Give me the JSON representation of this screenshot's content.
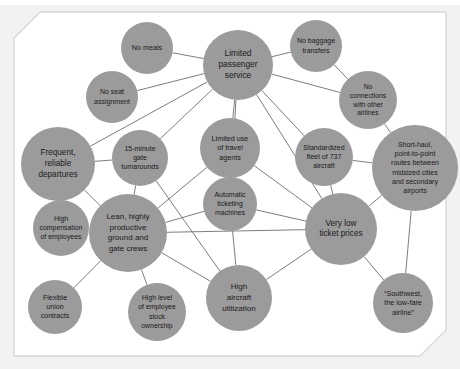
{
  "figure": {
    "name": "southwest-airlines-activity-system-map",
    "background_color": "#f2f2f0",
    "panel_color": "#ffffff",
    "node_color": "#9b9b9b",
    "edge_color": "#6e6e6e",
    "label_color": "#1a1a1a"
  },
  "chart_data": {
    "type": "diagram",
    "subtype": "activity-system-map",
    "title": "",
    "nodes": [
      {
        "id": "no_meals",
        "label": "No meals",
        "cx": 147,
        "cy": 48,
        "r": 26,
        "font_size": 7.2,
        "lines": [
          "No meals"
        ]
      },
      {
        "id": "no_seat",
        "label": "No seat assignment",
        "cx": 112,
        "cy": 97,
        "r": 26,
        "font_size": 7.0,
        "lines": [
          "No seat",
          "assignment"
        ]
      },
      {
        "id": "limited_passenger",
        "label": "Limited passenger service",
        "cx": 238,
        "cy": 65,
        "r": 35,
        "font_size": 8.4,
        "lines": [
          "Limited",
          "passenger",
          "service"
        ]
      },
      {
        "id": "no_baggage",
        "label": "No baggage transfers",
        "cx": 316,
        "cy": 46,
        "r": 26,
        "font_size": 7.0,
        "lines": [
          "No baggage",
          "transfers"
        ]
      },
      {
        "id": "no_connections",
        "label": "No connections with other airlines",
        "cx": 368,
        "cy": 100,
        "r": 29,
        "font_size": 6.8,
        "lines": [
          "No",
          "connections",
          "with other",
          "airlines"
        ]
      },
      {
        "id": "frequent_departures",
        "label": "Frequent, reliable departures",
        "cx": 58,
        "cy": 164,
        "r": 37,
        "font_size": 8.2,
        "lines": [
          "Frequent,",
          "reliable",
          "departures"
        ]
      },
      {
        "id": "gate_turnarounds",
        "label": "15-minute gate turnarounds",
        "cx": 140,
        "cy": 158,
        "r": 28,
        "font_size": 7.0,
        "lines": [
          "15-minute",
          "gate",
          "turnarounds"
        ]
      },
      {
        "id": "travel_agents",
        "label": "Limited use of travel agents",
        "cx": 230,
        "cy": 148,
        "r": 30,
        "font_size": 7.2,
        "lines": [
          "Limited use",
          "of travel",
          "agents"
        ]
      },
      {
        "id": "standardized_fleet",
        "label": "Standardized fleet of 737 aircraft",
        "cx": 324,
        "cy": 157,
        "r": 29,
        "font_size": 7.0,
        "lines": [
          "Standardized",
          "fleet of 737",
          "aircraft"
        ]
      },
      {
        "id": "short_haul",
        "label": "Short-haul, point-to-point routes between midsized cities and secondary airports",
        "cx": 415,
        "cy": 168,
        "r": 43,
        "font_size": 7.0,
        "lines": [
          "Short-haul,",
          "point-to-point",
          "routes between",
          "midsized cities",
          "and secondary",
          "airports"
        ]
      },
      {
        "id": "ticketing_machines",
        "label": "Automatic ticketing machines",
        "cx": 230,
        "cy": 204,
        "r": 27,
        "font_size": 7.0,
        "lines": [
          "Automatic",
          "ticketing",
          "machines"
        ]
      },
      {
        "id": "high_compensation",
        "label": "High compensation of employees",
        "cx": 61,
        "cy": 228,
        "r": 28,
        "font_size": 6.9,
        "lines": [
          "High",
          "compensation",
          "of employees"
        ]
      },
      {
        "id": "lean_crews",
        "label": "Lean, highly productive ground and gate crews",
        "cx": 128,
        "cy": 233,
        "r": 39,
        "font_size": 8.0,
        "lines": [
          "Lean, highly",
          "productive",
          "ground and",
          "gate crews"
        ]
      },
      {
        "id": "very_low_prices",
        "label": "Very low ticket prices",
        "cx": 341,
        "cy": 229,
        "r": 36,
        "font_size": 8.2,
        "lines": [
          "Very low",
          "ticket prices"
        ]
      },
      {
        "id": "flexible_union",
        "label": "Flexible union contracts",
        "cx": 55,
        "cy": 307,
        "r": 27,
        "font_size": 7.0,
        "lines": [
          "Flexible",
          "union",
          "contracts"
        ]
      },
      {
        "id": "stock_ownership",
        "label": "High level of employee stock ownership",
        "cx": 157,
        "cy": 312,
        "r": 29,
        "font_size": 6.9,
        "lines": [
          "High level",
          "of employee",
          "stock",
          "ownership"
        ]
      },
      {
        "id": "aircraft_util",
        "label": "High aircraft utilization",
        "cx": 239,
        "cy": 298,
        "r": 33,
        "font_size": 8.0,
        "lines": [
          "High",
          "aircraft",
          "utilization"
        ]
      },
      {
        "id": "southwest_slogan",
        "label": "“Southwest, the low-fare airline”",
        "cx": 403,
        "cy": 303,
        "r": 30,
        "font_size": 7.2,
        "lines": [
          "“Southwest,",
          "the low-fare",
          "airline”"
        ]
      }
    ],
    "edges": [
      {
        "from": "no_meals",
        "to": "limited_passenger"
      },
      {
        "from": "no_seat",
        "to": "limited_passenger"
      },
      {
        "from": "no_baggage",
        "to": "limited_passenger"
      },
      {
        "from": "no_connections",
        "to": "limited_passenger"
      },
      {
        "from": "no_baggage",
        "to": "no_connections"
      },
      {
        "from": "no_connections",
        "to": "short_haul"
      },
      {
        "from": "limited_passenger",
        "to": "travel_agents"
      },
      {
        "from": "limited_passenger",
        "to": "gate_turnarounds"
      },
      {
        "from": "limited_passenger",
        "to": "standardized_fleet"
      },
      {
        "from": "limited_passenger",
        "to": "very_low_prices"
      },
      {
        "from": "limited_passenger",
        "to": "ticketing_machines"
      },
      {
        "from": "frequent_departures",
        "to": "gate_turnarounds"
      },
      {
        "from": "frequent_departures",
        "to": "lean_crews"
      },
      {
        "from": "frequent_departures",
        "to": "limited_passenger"
      },
      {
        "from": "gate_turnarounds",
        "to": "lean_crews"
      },
      {
        "from": "gate_turnarounds",
        "to": "aircraft_util"
      },
      {
        "from": "travel_agents",
        "to": "ticketing_machines"
      },
      {
        "from": "travel_agents",
        "to": "very_low_prices"
      },
      {
        "from": "ticketing_machines",
        "to": "very_low_prices"
      },
      {
        "from": "ticketing_machines",
        "to": "lean_crews"
      },
      {
        "from": "ticketing_machines",
        "to": "aircraft_util"
      },
      {
        "from": "standardized_fleet",
        "to": "very_low_prices"
      },
      {
        "from": "standardized_fleet",
        "to": "short_haul"
      },
      {
        "from": "short_haul",
        "to": "very_low_prices"
      },
      {
        "from": "short_haul",
        "to": "southwest_slogan"
      },
      {
        "from": "very_low_prices",
        "to": "aircraft_util"
      },
      {
        "from": "very_low_prices",
        "to": "southwest_slogan"
      },
      {
        "from": "very_low_prices",
        "to": "lean_crews"
      },
      {
        "from": "high_compensation",
        "to": "lean_crews"
      },
      {
        "from": "lean_crews",
        "to": "flexible_union"
      },
      {
        "from": "lean_crews",
        "to": "stock_ownership"
      },
      {
        "from": "lean_crews",
        "to": "aircraft_util"
      },
      {
        "from": "lean_crews",
        "to": "travel_agents"
      }
    ]
  }
}
